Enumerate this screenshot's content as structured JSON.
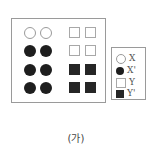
{
  "figure": {
    "caption": "(가)",
    "grid": {
      "rows": [
        [
          "X",
          "X",
          "Y",
          "Y"
        ],
        [
          "X'",
          "X'",
          "Y",
          "Y"
        ],
        [
          "X'",
          "X'",
          "Y'",
          "Y'"
        ],
        [
          "X'",
          "X'",
          "Y'",
          "Y'"
        ]
      ]
    },
    "legend": [
      {
        "symbol": "open-circle",
        "label": "X"
      },
      {
        "symbol": "filled-circle",
        "label": "X'"
      },
      {
        "symbol": "open-square",
        "label": "Y"
      },
      {
        "symbol": "filled-square",
        "label": "Y'"
      }
    ]
  }
}
